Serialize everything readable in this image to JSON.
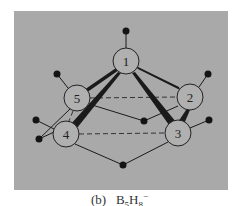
{
  "figure": {
    "panel_color": "#a9a9a9",
    "caption": {
      "label": "(b)",
      "formula_base": "B",
      "b_count": "5",
      "h_base": "H",
      "h_count": "8",
      "charge": "−"
    },
    "atoms": [
      {
        "id": "1",
        "label": "1",
        "x": 126,
        "y": 61
      },
      {
        "id": "2",
        "label": "2",
        "x": 190,
        "y": 97
      },
      {
        "id": "3",
        "label": "3",
        "x": 178,
        "y": 133
      },
      {
        "id": "4",
        "label": "4",
        "x": 66,
        "y": 134
      },
      {
        "id": "5",
        "label": "5",
        "x": 77,
        "y": 98
      }
    ],
    "hydrogens": [
      {
        "id": "h1",
        "x": 126,
        "y": 31
      },
      {
        "id": "h2",
        "x": 208,
        "y": 74
      },
      {
        "id": "h3",
        "x": 209,
        "y": 120
      },
      {
        "id": "h4",
        "x": 36,
        "y": 120
      },
      {
        "id": "h5",
        "x": 57,
        "y": 74
      },
      {
        "id": "h-bridge-45",
        "x": 39,
        "y": 139
      },
      {
        "id": "h-bridge-52-mid",
        "x": 144,
        "y": 121
      },
      {
        "id": "h-bridge-43",
        "x": 123,
        "y": 165
      }
    ],
    "colors": {
      "bond": "#1a1a1a",
      "atom_fill": "#b0b0b0",
      "atom_stroke": "#222222",
      "hydrogen": "#141414",
      "dashed": "#333333"
    }
  }
}
